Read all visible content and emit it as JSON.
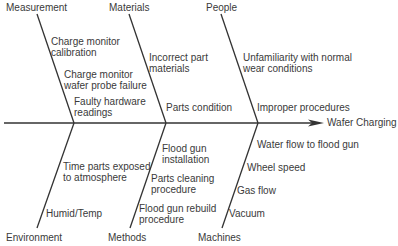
{
  "diagram": {
    "type": "fishbone",
    "effect": "Wafer Charging",
    "line_color": "#333333",
    "categories": {
      "measurement": {
        "label": "Measurement",
        "causes": [
          "Charge monitor calibration",
          "Charge monitor wafer probe failure",
          "Faulty hardware readings"
        ]
      },
      "materials": {
        "label": "Materials",
        "causes": [
          "Incorrect part materials",
          "Parts condition"
        ]
      },
      "people": {
        "label": "People",
        "causes": [
          "Unfamiliarity with normal wear conditions",
          "Improper procedures"
        ]
      },
      "environment": {
        "label": "Environment",
        "causes": [
          "Time parts exposed to atmosphere",
          "Humid/Temp"
        ]
      },
      "methods": {
        "label": "Methods",
        "causes": [
          "Flood gun installation",
          "Parts cleaning procedure",
          "Flood gun rebuild procedure"
        ]
      },
      "machines": {
        "label": "Machines",
        "causes": [
          "Water flow to flood gun",
          "Wheel speed",
          "Gas flow",
          "Vacuum"
        ]
      }
    }
  },
  "text": {
    "measurement": "Measurement",
    "materials": "Materials",
    "people": "People",
    "environment": "Environment",
    "methods": "Methods",
    "machines": "Machines",
    "effect": "Wafer Charging",
    "m1a": "Charge monitor",
    "m1b": "calibration",
    "m2a": "Charge monitor",
    "m2b": "wafer probe failure",
    "m3a": "Faulty hardware",
    "m3b": "readings",
    "mat1a": "Incorrect part",
    "mat1b": "materials",
    "mat2": "Parts condition",
    "p1a": "Unfamiliarity with normal",
    "p1b": "wear conditions",
    "p2": "Improper procedures",
    "e1a": "Time parts exposed",
    "e1b": "to atmosphere",
    "e2": "Humid/Temp",
    "me1a": "Flood gun",
    "me1b": "installation",
    "me2a": "Parts cleaning",
    "me2b": "procedure",
    "me3a": "Flood gun rebuild",
    "me3b": "procedure",
    "ma1": "Water flow to flood gun",
    "ma2": "Wheel speed",
    "ma3": "Gas flow",
    "ma4": "Vacuum"
  }
}
